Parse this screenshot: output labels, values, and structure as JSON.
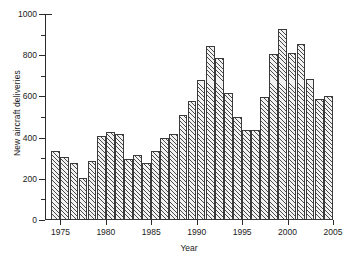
{
  "chart_data": {
    "type": "bar",
    "title": "",
    "xlabel": "Year",
    "ylabel": "New aircraft deliveries",
    "xlim": [
      1973.3,
      2005.0
    ],
    "ylim": [
      0,
      1000
    ],
    "grid": false,
    "legend": null,
    "ytick_labels": [
      "0",
      "200",
      "400",
      "600",
      "800",
      "1000"
    ],
    "ytick_values": [
      0,
      200,
      400,
      600,
      800,
      1000
    ],
    "yminor_values": [
      100,
      300,
      500,
      700,
      900
    ],
    "xtick_labels": [
      "1975",
      "1980",
      "1985",
      "1990",
      "1995",
      "2000",
      "2005"
    ],
    "xtick_values": [
      1975,
      1980,
      1985,
      1990,
      1995,
      2000,
      2005
    ],
    "categories": [
      1974,
      1975,
      1976,
      1977,
      1978,
      1979,
      1980,
      1981,
      1982,
      1983,
      1984,
      1985,
      1986,
      1987,
      1988,
      1989,
      1990,
      1991,
      1992,
      1993,
      1994,
      1995,
      1996,
      1997,
      1998,
      1999,
      2000,
      2001,
      2002,
      2003,
      2004
    ],
    "values": [
      335,
      308,
      277,
      202,
      288,
      410,
      426,
      417,
      295,
      317,
      276,
      334,
      400,
      417,
      510,
      578,
      678,
      845,
      787,
      616,
      499,
      437,
      437,
      595,
      808,
      927,
      812,
      855,
      683,
      588,
      602
    ],
    "bar_face_color": "#f2f2f2",
    "bar_edge_color": "#3a3a3a",
    "bar_hatch": "diagonal-forward-slash",
    "axis_color": "#2b2b2b"
  }
}
